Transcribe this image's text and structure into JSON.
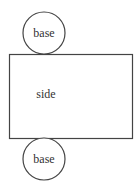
{
  "diagram": {
    "top_circle": {
      "label": "base",
      "cx": 44,
      "cy": 33,
      "r": 21
    },
    "rectangle": {
      "label": "side",
      "x": 9,
      "y": 54,
      "width": 123,
      "height": 84
    },
    "bottom_circle": {
      "label": "base",
      "cx": 44,
      "cy": 159,
      "r": 21
    },
    "colors": {
      "stroke": "#444444",
      "circle_fill": "#ffffff",
      "text": "#333333"
    }
  }
}
